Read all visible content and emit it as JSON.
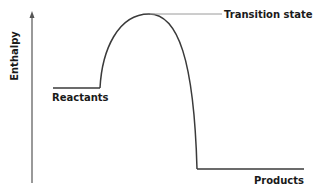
{
  "diagram": {
    "type": "enthalpy-reaction-profile",
    "y_axis_label": "Enthalpy",
    "labels": {
      "reactants": "Reactants",
      "transition_state": "Transition state",
      "products": "Products"
    },
    "colors": {
      "curve": "#3a3a3a",
      "axis": "#555555",
      "leader_line": "#9a9a9a",
      "text": "#1a1a1a"
    }
  }
}
